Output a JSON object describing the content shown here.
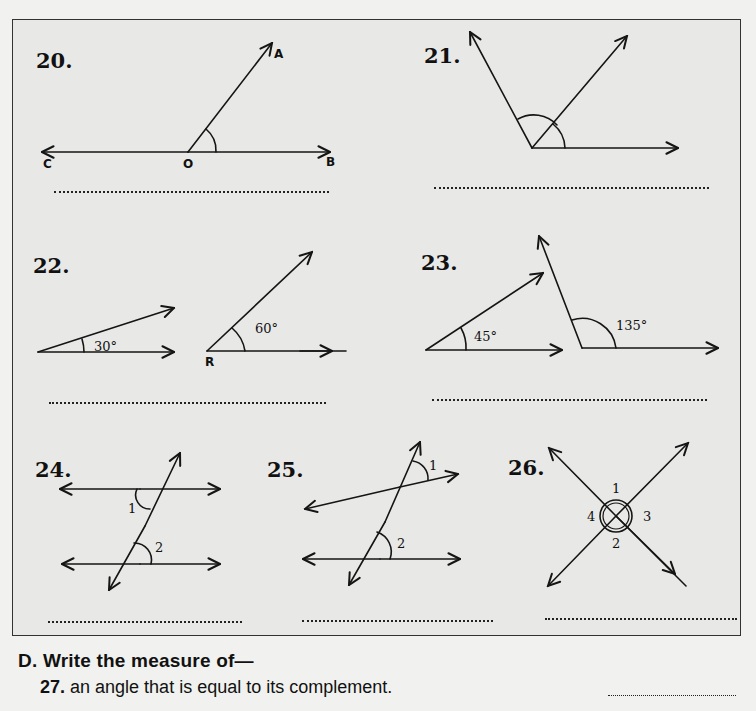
{
  "questions": [
    {
      "number": "20.",
      "labels": {
        "A": "A",
        "O": "O",
        "B": "B",
        "C": "C"
      },
      "answer_blank": ""
    },
    {
      "number": "21.",
      "answer_blank": ""
    },
    {
      "number": "22.",
      "angles": [
        "30°",
        "60°"
      ],
      "vertex_label": "R",
      "answer_blank": ""
    },
    {
      "number": "23.",
      "angles": [
        "45°",
        "135°"
      ],
      "answer_blank": ""
    },
    {
      "number": "24.",
      "angle_labels": [
        "1",
        "2"
      ],
      "answer_blank": ""
    },
    {
      "number": "25.",
      "angle_labels": [
        "1",
        "2"
      ],
      "answer_blank": ""
    },
    {
      "number": "26.",
      "angle_labels": [
        "1",
        "2",
        "3",
        "4"
      ],
      "answer_blank": ""
    }
  ],
  "section_d": {
    "heading": "D. Write the measure of—",
    "items": [
      {
        "number": "27.",
        "text": "an angle that is equal to its complement.",
        "answer_blank": ""
      }
    ]
  }
}
